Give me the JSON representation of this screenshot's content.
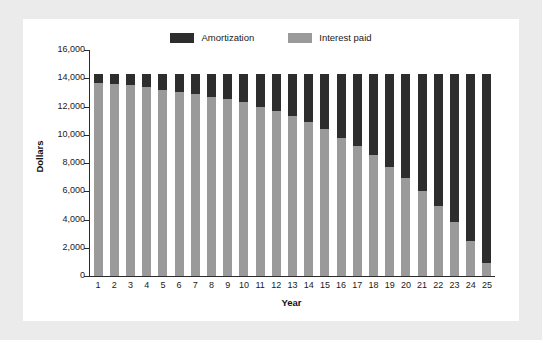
{
  "chart_data": {
    "type": "bar",
    "subtype": "stacked-bar",
    "title": "",
    "xlabel": "Year",
    "ylabel": "Dollars",
    "ylim": [
      0,
      16000
    ],
    "ytick_labels": [
      "0",
      "2,000",
      "4,000",
      "6,000",
      "8,000",
      "10,000",
      "12,000",
      "14,000",
      "16,000"
    ],
    "ytick_values": [
      0,
      2000,
      4000,
      6000,
      8000,
      10000,
      12000,
      14000,
      16000
    ],
    "grid": false,
    "legend_position": "top-center",
    "categories": [
      "1",
      "2",
      "3",
      "4",
      "5",
      "6",
      "7",
      "8",
      "9",
      "10",
      "11",
      "12",
      "13",
      "14",
      "15",
      "16",
      "17",
      "18",
      "19",
      "20",
      "21",
      "22",
      "23",
      "24",
      "25"
    ],
    "series": [
      {
        "name": "Interest paid",
        "color": "#9a9a9a",
        "values": [
          13700,
          13600,
          13500,
          13350,
          13200,
          13050,
          12900,
          12700,
          12500,
          12300,
          11950,
          11650,
          11300,
          10900,
          10400,
          9750,
          9200,
          8550,
          7750,
          6950,
          6000,
          4950,
          3800,
          2450,
          900
        ]
      },
      {
        "name": "Amortization",
        "color": "#2d2d2d",
        "values": [
          600,
          700,
          800,
          950,
          1100,
          1250,
          1400,
          1600,
          1800,
          2000,
          2350,
          2650,
          3000,
          3400,
          3900,
          4550,
          5100,
          5750,
          6550,
          7350,
          8300,
          9350,
          10500,
          11850,
          13400
        ]
      }
    ],
    "stack_totals": [
      14300,
      14300,
      14300,
      14300,
      14300,
      14300,
      14300,
      14300,
      14300,
      14300,
      14300,
      14300,
      14300,
      14300,
      14300,
      14300,
      14300,
      14300,
      14300,
      14300,
      14300,
      14300,
      14300,
      14300,
      14300
    ]
  },
  "legend": {
    "entries": [
      {
        "label": "Amortization",
        "color": "#2d2d2d"
      },
      {
        "label": "Interest paid",
        "color": "#9a9a9a"
      }
    ]
  },
  "axes": {
    "x_title": "Year",
    "y_title": "Dollars"
  },
  "colors": {
    "page_background": "#ebebeb",
    "panel_background": "#ffffff",
    "axis": "#2b2b2b",
    "amortization": "#2d2d2d",
    "interest": "#9a9a9a"
  }
}
